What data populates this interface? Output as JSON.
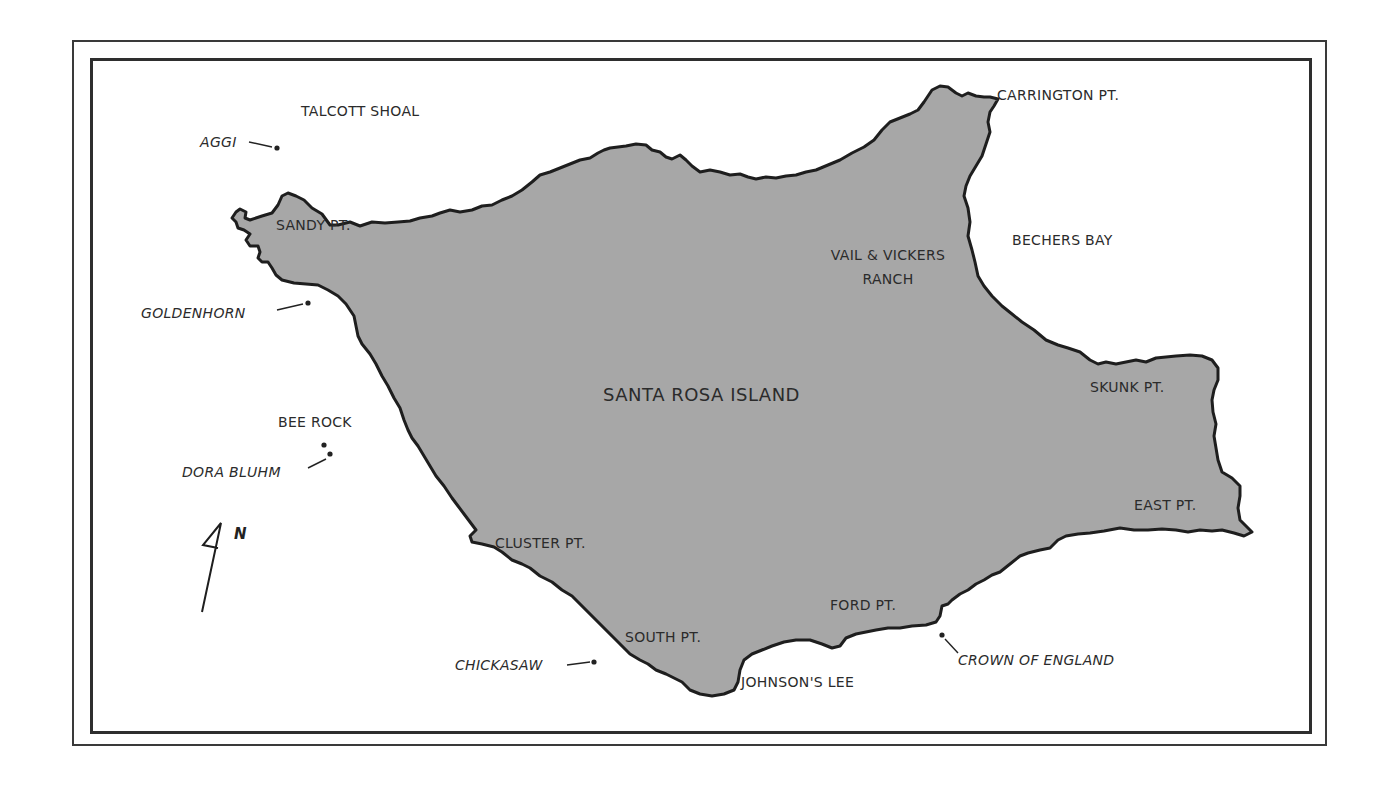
{
  "map": {
    "title": "SANTA ROSA ISLAND",
    "colors": {
      "land": "#a7a7a7",
      "coastline": "#1e1e1e",
      "water": "#ffffff",
      "frame": "#2e2e2e",
      "text": "#2b2b2b"
    },
    "island_label": "SANTA ROSA ISLAND",
    "place_labels": {
      "talcott_shoal": "TALCOTT SHOAL",
      "carrington_pt": "CARRINGTON PT.",
      "sandy_pt": "SANDY PT.",
      "vail_vickers_line1": "VAIL & VICKERS",
      "vail_vickers_line2": "RANCH",
      "bechers_bay": "BECHERS BAY",
      "skunk_pt": "SKUNK PT.",
      "east_pt": "EAST PT.",
      "bee_rock": "BEE ROCK",
      "cluster_pt": "CLUSTER PT.",
      "ford_pt": "FORD PT.",
      "south_pt": "SOUTH PT.",
      "johnsons_lee": "JOHNSON'S LEE"
    },
    "shipwreck_labels": {
      "aggi": "AGGI",
      "goldenhorn": "GOLDENHORN",
      "dora_bluhm": "DORA BLUHM",
      "chickasaw": "CHICKASAW",
      "crown_of_england": "CROWN OF ENGLAND"
    },
    "north_arrow": {
      "label": "N"
    }
  }
}
